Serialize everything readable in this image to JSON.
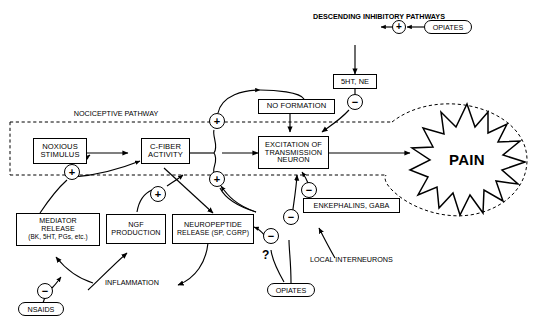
{
  "diagram": {
    "region_label": "NOCICEPTIVE PATHWAY",
    "question_marker": "?",
    "pain_label": "PAIN"
  },
  "nodes": {
    "noxious_stimulus": {
      "line1": "NOXIOUS",
      "line2": "STIMULUS"
    },
    "c_fiber": {
      "line1": "C-FIBER",
      "line2": "ACTIVITY"
    },
    "excitation": {
      "line1": "EXCITATION OF",
      "line2": "TRANSMISSION",
      "line3": "NEURON"
    },
    "no_formation": {
      "line1": "NO FORMATION"
    },
    "five_ht_ne": {
      "line1": "5HT, NE"
    },
    "enkephalins": {
      "line1": "ENKEPHALINS, GABA"
    },
    "mediator_release": {
      "line1": "MEDIATOR",
      "line2": "RELEASE",
      "line3": "(BK, 5HT, PGs, etc.)"
    },
    "ngf_production": {
      "line1": "NGF",
      "line2": "PRODUCTION"
    },
    "neuropeptide_release": {
      "line1": "NEUROPEPTIDE",
      "line2": "RELEASE (SP, CGRP)"
    }
  },
  "pills": {
    "opiates_top": "OPIATES",
    "opiates_bottom": "OPIATES",
    "nsaids": "NSAIDS"
  },
  "plain_labels": {
    "descending": {
      "line1": "DESCENDING",
      "line2": "INHIBITORY",
      "line3": "PATHWAYS"
    },
    "local_interneurons": {
      "line1": "LOCAL",
      "line2": "INTERNEURONS"
    },
    "inflammation": "INFLAMMATION"
  },
  "signs": {
    "plus_opiates_top": "+",
    "plus_mediator_to_stimulus": "+",
    "plus_cfiber_up": "+",
    "plus_cfiber_down": "+",
    "plus_ngf": "+",
    "minus_5ht_ne": "−",
    "minus_enkephalins": "−",
    "minus_opiates_excitation": "−",
    "minus_opiates_neuropeptide": "−",
    "minus_nsaids": "−"
  },
  "colors": {
    "ink": "#000000",
    "paper": "#ffffff"
  }
}
